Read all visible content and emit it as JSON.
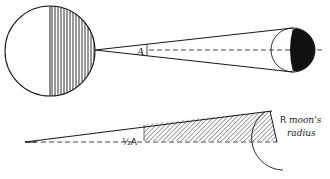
{
  "diagram": {
    "type": "eclipse-geometry",
    "colors": {
      "ink": "#1a1a1a",
      "background": "#ffffff"
    },
    "upper": {
      "earth": {
        "cx": 50,
        "cy": 51,
        "r": 45,
        "shading": "right-half-vertical-hatch"
      },
      "moon": {
        "cx": 300,
        "cy": 50,
        "r": 22,
        "shading": "right-part-solid-black"
      },
      "cone_apex_label": "A",
      "axis_style": "dashed"
    },
    "lower": {
      "angle_label": "½A",
      "side_label": "R",
      "side_description_line1": "moon's",
      "side_description_line2": "radius",
      "shading": "diagonal-hatch"
    }
  }
}
